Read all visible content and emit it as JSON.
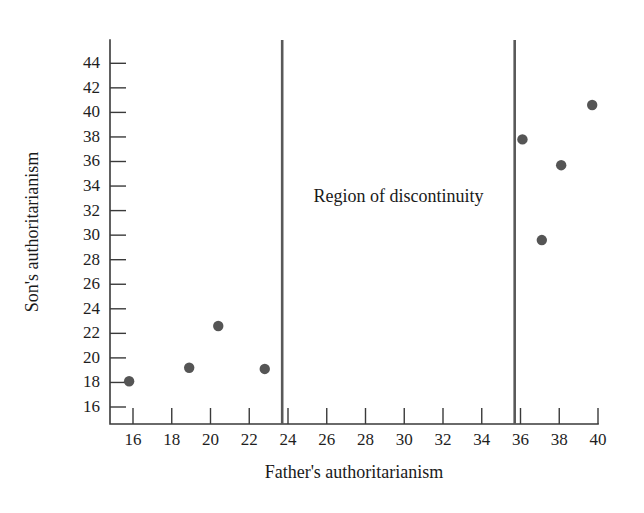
{
  "chart_data": {
    "type": "scatter",
    "title": "",
    "xlabel": "Father's authoritarianism",
    "ylabel": "Son's authoritarianism",
    "xlim": [
      14.7,
      40.0
    ],
    "ylim": [
      14.7,
      45.3
    ],
    "xticks": [
      16,
      18,
      20,
      22,
      24,
      26,
      28,
      30,
      32,
      34,
      36,
      38,
      40
    ],
    "yticks": [
      16,
      18,
      20,
      22,
      24,
      26,
      28,
      30,
      32,
      34,
      36,
      38,
      40,
      42,
      44
    ],
    "grid": false,
    "legend": false,
    "points": [
      {
        "x": 15.8,
        "y": 18.1
      },
      {
        "x": 18.9,
        "y": 19.2
      },
      {
        "x": 20.4,
        "y": 22.6
      },
      {
        "x": 22.8,
        "y": 19.1
      },
      {
        "x": 36.1,
        "y": 37.8
      },
      {
        "x": 37.1,
        "y": 29.6
      },
      {
        "x": 38.1,
        "y": 35.7
      },
      {
        "x": 39.7,
        "y": 40.6
      }
    ],
    "vlines": [
      {
        "x": 23.7,
        "label": "left-discontinuity-boundary"
      },
      {
        "x": 35.7,
        "label": "right-discontinuity-boundary"
      }
    ],
    "annotations": [
      {
        "text": "Region of discontinuity",
        "x": 29.7,
        "y": 33.0
      }
    ],
    "colors": {
      "point": "#555555",
      "axis": "#3a3a3a",
      "vline": "#595959",
      "text": "#1a1a1a",
      "background": "#ffffff"
    }
  }
}
